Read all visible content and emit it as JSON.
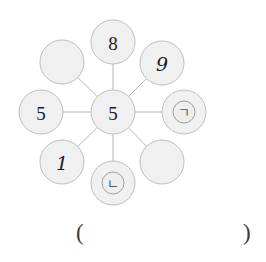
{
  "worksheet": {
    "type": "number-web-diagram",
    "background_color": "#ffffff"
  },
  "diagram": {
    "name": "radial-number-web",
    "spoke_color": "#b0b0b0",
    "node_fill": "#f0f0f0",
    "node_stroke": "#bdbdbd",
    "center": {
      "id": "center",
      "label": "5",
      "cx": 113,
      "cy": 112,
      "r": 22
    },
    "outer_nodes": [
      {
        "id": "node-n",
        "position": "top",
        "label": "8",
        "style": "digit",
        "cx": 113,
        "cy": 42,
        "r": 22,
        "inner_ring": false
      },
      {
        "id": "node-ne",
        "position": "top-right",
        "label": "9",
        "style": "handwritten",
        "cx": 162,
        "cy": 63,
        "r": 22,
        "inner_ring": false
      },
      {
        "id": "node-e",
        "position": "right",
        "label": "ㄱ",
        "style": "hangul",
        "cx": 184,
        "cy": 112,
        "r": 22,
        "inner_ring": true
      },
      {
        "id": "node-se",
        "position": "bottom-right",
        "label": "",
        "style": "empty",
        "cx": 162,
        "cy": 162,
        "r": 22,
        "inner_ring": false
      },
      {
        "id": "node-s",
        "position": "bottom",
        "label": "ㄴ",
        "style": "hangul",
        "cx": 113,
        "cy": 183,
        "r": 22,
        "inner_ring": true
      },
      {
        "id": "node-sw",
        "position": "bottom-left",
        "label": "1",
        "style": "digit",
        "cx": 62,
        "cy": 162,
        "r": 22,
        "inner_ring": false
      },
      {
        "id": "node-w",
        "position": "left",
        "label": "5",
        "style": "digit",
        "cx": 41,
        "cy": 112,
        "r": 22,
        "inner_ring": false
      },
      {
        "id": "node-nw",
        "position": "top-left",
        "label": "",
        "style": "empty",
        "cx": 62,
        "cy": 62,
        "r": 22,
        "inner_ring": false
      }
    ]
  },
  "answer": {
    "open_paren": "(",
    "close_paren": ")",
    "value": "",
    "placeholder": ""
  }
}
